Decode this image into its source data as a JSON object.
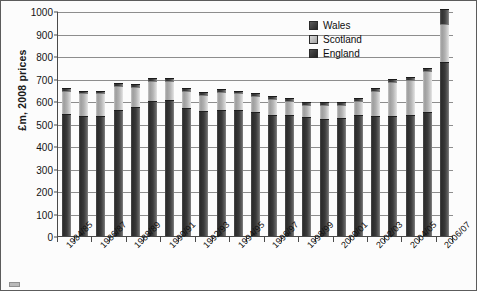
{
  "chart_data": {
    "type": "bar",
    "subtype": "stacked-column",
    "title": "",
    "xlabel": "",
    "ylabel": "£m, 2008 prices",
    "ylim": [
      0,
      1000
    ],
    "ytick_step": 100,
    "yticks": [
      0,
      100,
      200,
      300,
      400,
      500,
      600,
      700,
      800,
      900,
      1000
    ],
    "grid": true,
    "grid_axis": "y",
    "legend_position": "top-right",
    "categories": [
      "1984/85",
      "1985/86",
      "1986/87",
      "1987/88",
      "1988/89",
      "1989/90",
      "1990/91",
      "1991/92",
      "1992/93",
      "1993/94",
      "1994/95",
      "1995/96",
      "1996/97",
      "1997/98",
      "1998/99",
      "1999/00",
      "2000/01",
      "2001/02",
      "2002/03",
      "2003/04",
      "2004/05",
      "2005/06",
      "2006/07"
    ],
    "tick_labels_shown": [
      "1984/85",
      "1986/87",
      "1988/89",
      "1990/91",
      "1992/93",
      "1994/95",
      "1996/97",
      "1998/99",
      "2000/01",
      "2002/03",
      "2004/05",
      "2006/07"
    ],
    "series": [
      {
        "name": "England",
        "color": "#333333",
        "values": [
          540,
          530,
          530,
          555,
          570,
          595,
          600,
          565,
          550,
          555,
          555,
          545,
          535,
          535,
          525,
          515,
          520,
          535,
          530,
          530,
          535,
          545,
          770
        ]
      },
      {
        "name": "Scotland",
        "color": "#b4b4b4",
        "values": [
          95,
          95,
          95,
          105,
          85,
          85,
          80,
          70,
          70,
          75,
          70,
          70,
          65,
          55,
          50,
          60,
          55,
          55,
          105,
          145,
          150,
          180,
          165
        ]
      },
      {
        "name": "Wales",
        "color": "#3a3a3a",
        "values": [
          8,
          8,
          8,
          8,
          8,
          8,
          8,
          8,
          8,
          8,
          8,
          8,
          8,
          8,
          8,
          8,
          8,
          8,
          8,
          10,
          10,
          10,
          60
        ]
      }
    ],
    "totals": [
      643,
      633,
      633,
      668,
      663,
      688,
      688,
      643,
      628,
      638,
      633,
      623,
      608,
      598,
      583,
      583,
      583,
      598,
      643,
      685,
      695,
      735,
      995
    ]
  },
  "legend": {
    "items": [
      {
        "label": "Wales",
        "swatch": "wales-swatch"
      },
      {
        "label": "Scotland",
        "swatch": "scotland-swatch"
      },
      {
        "label": "England",
        "swatch": "england-swatch"
      }
    ]
  }
}
